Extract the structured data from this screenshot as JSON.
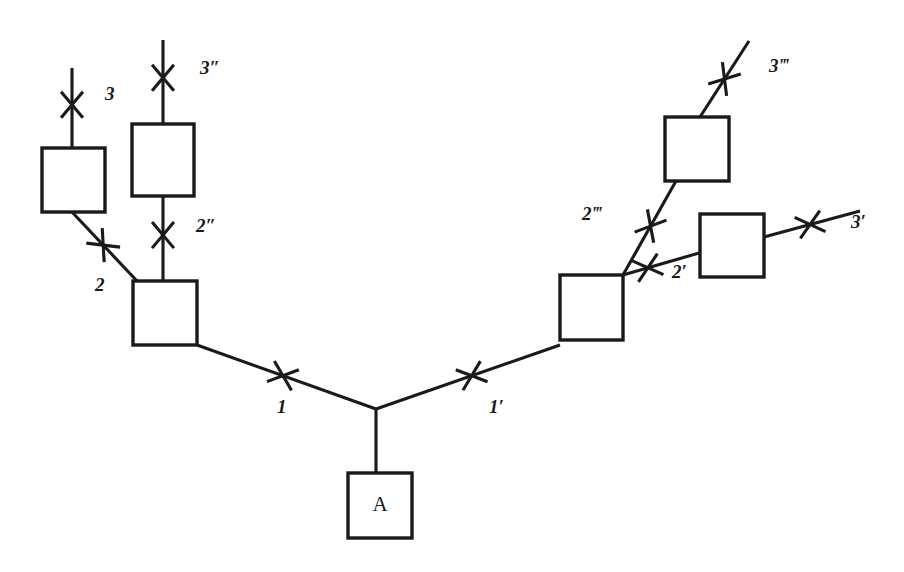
{
  "figure": {
    "kind": "tree-diagram",
    "background_color": "#ffffff",
    "stroke_color": "#1a1a1a",
    "width": 904,
    "height": 572
  },
  "nodes": [
    {
      "id": "A",
      "label": "A",
      "x": 348,
      "y": 473,
      "w": 64,
      "h": 65
    },
    {
      "id": "L1",
      "label": "",
      "x": 133,
      "y": 281,
      "w": 64,
      "h": 64
    },
    {
      "id": "L2",
      "label": "",
      "x": 42,
      "y": 148,
      "w": 63,
      "h": 64
    },
    {
      "id": "L2pp",
      "label": "",
      "x": 132,
      "y": 124,
      "w": 62,
      "h": 72
    },
    {
      "id": "R1",
      "label": "",
      "x": 560,
      "y": 275,
      "w": 63,
      "h": 65
    },
    {
      "id": "R2ppp",
      "label": "",
      "x": 665,
      "y": 117,
      "w": 64,
      "h": 64
    },
    {
      "id": "R2p",
      "label": "",
      "x": 700,
      "y": 214,
      "w": 64,
      "h": 63
    }
  ],
  "edges": [
    {
      "id": "e1",
      "label": "1",
      "label_x": 277,
      "label_y": 409,
      "x1": 376,
      "y1": 409,
      "x2": 197,
      "y2": 345,
      "hatch_t": 0.52
    },
    {
      "id": "e1p",
      "label": "1′",
      "label_x": 489,
      "label_y": 409,
      "x1": 376,
      "y1": 409,
      "x2": 560,
      "y2": 345,
      "hatch_t": 0.52
    },
    {
      "id": "eA",
      "label": "",
      "label_x": 0,
      "label_y": 0,
      "x1": 376,
      "y1": 409,
      "x2": 376,
      "y2": 473,
      "hatch_t": -1
    },
    {
      "id": "e2",
      "label": "2",
      "label_x": 95,
      "label_y": 287,
      "x1": 137,
      "y1": 281,
      "x2": 72,
      "y2": 212,
      "hatch_t": 0.52
    },
    {
      "id": "e2pp",
      "label": "2″",
      "label_x": 196,
      "label_y": 228,
      "x1": 163,
      "y1": 281,
      "x2": 163,
      "y2": 196,
      "hatch_t": 0.54
    },
    {
      "id": "e3",
      "label": "3",
      "label_x": 105,
      "label_y": 96,
      "x1": 72,
      "y1": 148,
      "x2": 72,
      "y2": 68,
      "hatch_t": 0.54
    },
    {
      "id": "e3pp",
      "label": "3″",
      "label_x": 200,
      "label_y": 70,
      "x1": 163,
      "y1": 124,
      "x2": 163,
      "y2": 40,
      "hatch_t": 0.55
    },
    {
      "id": "e2p",
      "label": "2′",
      "label_x": 672,
      "label_y": 274,
      "x1": 623,
      "y1": 275,
      "x2": 706,
      "y2": 251,
      "hatch_t": 0.3
    },
    {
      "id": "e2ppp",
      "label": "2‴",
      "label_x": 582,
      "label_y": 216,
      "x1": 623,
      "y1": 275,
      "x2": 676,
      "y2": 181,
      "hatch_t": 0.52
    },
    {
      "id": "e3p",
      "label": "3′",
      "label_x": 851,
      "label_y": 224,
      "x1": 764,
      "y1": 237,
      "x2": 860,
      "y2": 211,
      "hatch_t": 0.48
    },
    {
      "id": "e3ppp",
      "label": "3‴",
      "label_x": 769,
      "label_y": 68,
      "x1": 700,
      "y1": 117,
      "x2": 749,
      "y2": 41,
      "hatch_t": 0.5
    }
  ],
  "labels_list": [
    "1",
    "1′",
    "2",
    "2′",
    "2″",
    "2‴",
    "3",
    "3′",
    "3″",
    "3‴",
    "A"
  ]
}
